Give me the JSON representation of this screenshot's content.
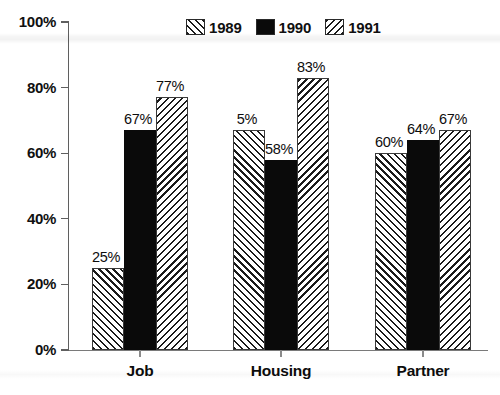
{
  "chart_data": {
    "type": "bar",
    "title": "",
    "subtitle": "",
    "xlabel": "",
    "ylabel": "",
    "categories": [
      "Job",
      "Housing",
      "Partner"
    ],
    "series": [
      {
        "name": "1989",
        "pattern": "diagonal-hatch-forward",
        "values": [
          25,
          67,
          60
        ]
      },
      {
        "name": "1990",
        "pattern": "solid-black",
        "values": [
          67,
          58,
          64
        ]
      },
      {
        "name": "1991",
        "pattern": "diagonal-hatch-back",
        "values": [
          77,
          83,
          67
        ]
      }
    ],
    "value_labels": [
      [
        "25%",
        "67%",
        "77%"
      ],
      [
        "5%",
        "58%",
        "83%"
      ],
      [
        "60%",
        "64%",
        "67%"
      ]
    ],
    "ylim": [
      0,
      100
    ],
    "ytick_values": [
      0,
      20,
      40,
      60,
      80,
      100
    ],
    "ytick_labels": [
      "0%",
      "20%",
      "40%",
      "60%",
      "80%",
      "100%"
    ],
    "grid": false,
    "legend_position": "top-center",
    "units": "percent",
    "colors": {
      "series_1989": "#ffffff",
      "series_1990": "#0a0a0a",
      "series_1991": "#ffffff",
      "hatch": "#1a1a1a",
      "axis": "#5f5f5f",
      "text": "#101010",
      "background": "#ffffff"
    }
  },
  "legend": {
    "entries": [
      {
        "label": "1989"
      },
      {
        "label": "1990"
      },
      {
        "label": "1991"
      }
    ]
  },
  "axis": {
    "y_labels": [
      "100%",
      "80%",
      "60%",
      "40%",
      "20%",
      "0%"
    ],
    "x_labels": [
      "Job",
      "Housing",
      "Partner"
    ]
  }
}
